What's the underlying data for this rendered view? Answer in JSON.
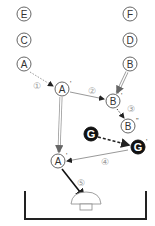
{
  "diagram": {
    "nodes": [
      {
        "id": "E",
        "label": "E",
        "x": 24,
        "y": 14,
        "style": "outline"
      },
      {
        "id": "C",
        "label": "C",
        "x": 24,
        "y": 40,
        "style": "outline"
      },
      {
        "id": "A",
        "label": "A",
        "x": 24,
        "y": 64,
        "style": "outline"
      },
      {
        "id": "F",
        "label": "F",
        "x": 130,
        "y": 14,
        "style": "outline"
      },
      {
        "id": "D",
        "label": "D",
        "x": 130,
        "y": 40,
        "style": "outline"
      },
      {
        "id": "B",
        "label": "B",
        "x": 130,
        "y": 64,
        "style": "outline"
      },
      {
        "id": "A1",
        "label": "A",
        "prime": "'",
        "x": 62,
        "y": 89,
        "style": "outline"
      },
      {
        "id": "B1",
        "label": "B",
        "prime": "'",
        "x": 113,
        "y": 101,
        "style": "outline"
      },
      {
        "id": "B2",
        "label": "B",
        "prime": "''",
        "x": 128,
        "y": 126,
        "style": "outline"
      },
      {
        "id": "G",
        "label": "G",
        "x": 91,
        "y": 134,
        "style": "filled"
      },
      {
        "id": "G1",
        "label": "G",
        "prime": "'",
        "x": 138,
        "y": 147,
        "style": "filled"
      },
      {
        "id": "A2",
        "label": "A",
        "prime": "'",
        "x": 58,
        "y": 161,
        "style": "outline"
      }
    ],
    "steps": [
      {
        "label": "①",
        "x": 37,
        "y": 86
      },
      {
        "label": "②",
        "x": 92,
        "y": 91
      },
      {
        "label": "③",
        "x": 131,
        "y": 109
      },
      {
        "label": "④",
        "x": 105,
        "y": 162
      },
      {
        "label": "⑤",
        "x": 81,
        "y": 183
      }
    ],
    "colors": {
      "line": "#333333",
      "gray": "#999999",
      "fill": "#111111"
    }
  }
}
